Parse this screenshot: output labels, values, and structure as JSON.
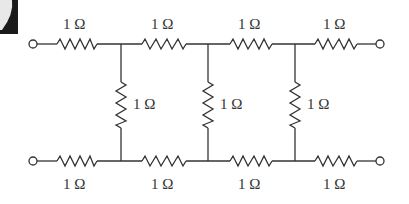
{
  "diagram": {
    "type": "resistor ladder network",
    "top_series": [
      {
        "id": "Rt1",
        "label": "1 Ω"
      },
      {
        "id": "Rt2",
        "label": "1 Ω"
      },
      {
        "id": "Rt3",
        "label": "1 Ω"
      },
      {
        "id": "Rt4",
        "label": "1 Ω"
      }
    ],
    "shunts": [
      {
        "id": "Rs1",
        "label": "1 Ω"
      },
      {
        "id": "Rs2",
        "label": "1 Ω"
      },
      {
        "id": "Rs3",
        "label": "1 Ω"
      }
    ],
    "bottom_series": [
      {
        "id": "Rb1",
        "label": "1 Ω"
      },
      {
        "id": "Rb2",
        "label": "1 Ω"
      },
      {
        "id": "Rb3",
        "label": "1 Ω"
      },
      {
        "id": "Rb4",
        "label": "1 Ω"
      }
    ],
    "terminals": [
      "top-left",
      "top-right",
      "bottom-left",
      "bottom-right"
    ],
    "colors": {
      "line": "#333333",
      "background": "#ffffff",
      "corner": "#1a1a1a"
    }
  }
}
